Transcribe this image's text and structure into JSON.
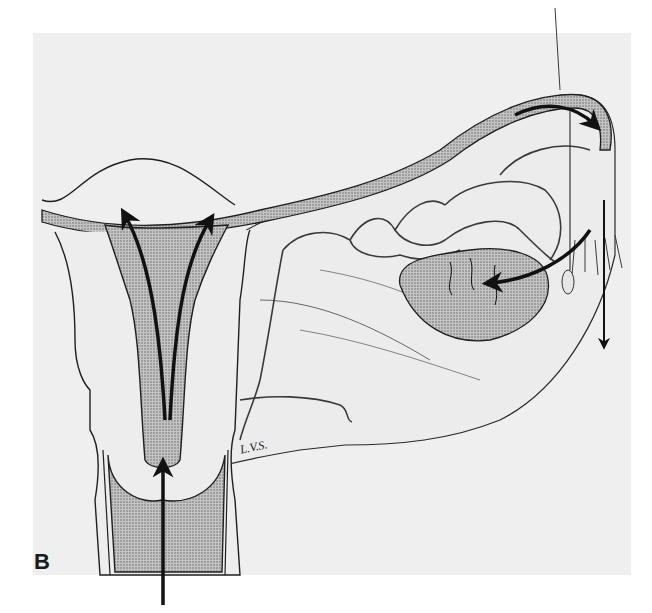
{
  "figure": {
    "panel_label": "B",
    "signature": "L.V.S.",
    "colors": {
      "background": "#ffffff",
      "panel": "#efefef",
      "stipple": "#8c8c8c",
      "line": "#1f1f1f",
      "arrow": "#111111"
    },
    "arrows": [
      {
        "id": "uterine-cavity-left-up",
        "direction": "up-left"
      },
      {
        "id": "uterine-cavity-right-up",
        "direction": "up-right"
      },
      {
        "id": "cervix-upward",
        "direction": "up"
      },
      {
        "id": "tube-toward-fimbria",
        "direction": "right"
      },
      {
        "id": "fimbria-to-ovary",
        "direction": "left"
      },
      {
        "id": "fimbria-downward",
        "direction": "down"
      }
    ]
  }
}
